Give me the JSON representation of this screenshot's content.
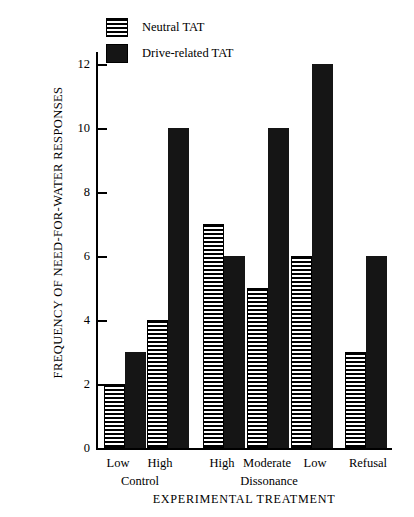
{
  "chart_data": {
    "type": "bar",
    "title": "",
    "xlabel": "EXPERIMENTAL TREATMENT",
    "ylabel": "FREQUENCY OF NEED-FOR-WATER RESPONSES",
    "ylim": [
      0,
      13
    ],
    "yticks": [
      0,
      2,
      4,
      6,
      8,
      10,
      12
    ],
    "ytick_labels": [
      "0",
      "2",
      "4",
      "6",
      "8",
      "10",
      "12"
    ],
    "grid": false,
    "legend_position": "top-left-inside",
    "categories": [
      "Low",
      "High",
      "High",
      "Moderate",
      "Low",
      "Refusal"
    ],
    "group_labels": [
      "Control",
      "Dissonance",
      ""
    ],
    "groups": [
      {
        "group": "Control",
        "levels": [
          {
            "label": "Low",
            "neutral": 2,
            "drive": 3
          },
          {
            "label": "High",
            "neutral": 4,
            "drive": 10
          }
        ]
      },
      {
        "group": "Dissonance",
        "levels": [
          {
            "label": "High",
            "neutral": 7,
            "drive": 6
          },
          {
            "label": "Moderate",
            "neutral": 5,
            "drive": 10
          },
          {
            "label": "Low",
            "neutral": 6,
            "drive": 12
          }
        ]
      },
      {
        "group": "",
        "levels": [
          {
            "label": "Refusal",
            "neutral": 3,
            "drive": 6
          }
        ]
      }
    ],
    "series": [
      {
        "name": "Neutral TAT",
        "fill": "horizontal-stripes",
        "color": "#000000",
        "values": [
          2,
          4,
          7,
          5,
          6,
          3
        ]
      },
      {
        "name": "Drive-related TAT",
        "fill": "solid",
        "color": "#151515",
        "values": [
          3,
          10,
          6,
          10,
          12,
          6
        ]
      }
    ]
  },
  "legend": {
    "items": [
      {
        "label": "Neutral TAT",
        "swatch": "striped-swatch-icon"
      },
      {
        "label": "Drive-related TAT",
        "swatch": "solid-swatch-icon"
      }
    ]
  },
  "axes": {
    "y_title": "FREQUENCY OF NEED-FOR-WATER RESPONSES",
    "x_title": "EXPERIMENTAL TREATMENT",
    "y_ticks": [
      "12",
      "10",
      "8",
      "6",
      "4",
      "2",
      "0"
    ],
    "x_level_labels": [
      "Low",
      "High",
      "High",
      "Moderate",
      "Low",
      "Refusal"
    ],
    "x_group_labels": [
      "Control",
      "Dissonance"
    ]
  }
}
